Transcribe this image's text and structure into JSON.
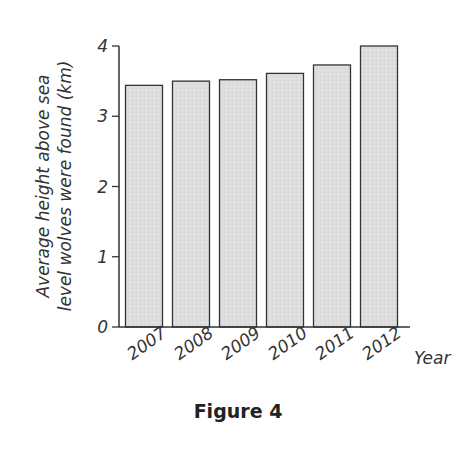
{
  "figure": {
    "caption": "Figure 4"
  },
  "chart_data": {
    "type": "bar",
    "title": "",
    "categories": [
      "2007",
      "2008",
      "2009",
      "2010",
      "2011",
      "2012"
    ],
    "values": [
      3.44,
      3.5,
      3.52,
      3.61,
      3.73,
      4.0
    ],
    "xlabel": "Year",
    "ylabel": "Average height above sea level wolves were found (km)",
    "ylabel_lines": [
      "Average height above sea",
      "level wolves were found (km)"
    ],
    "yticks": [
      0,
      1,
      2,
      3,
      4
    ],
    "ylim": [
      0,
      4
    ],
    "grid": false,
    "legend": null,
    "colors": {
      "bar_fill": "#dedede",
      "bar_stroke": "#333333",
      "axis": "#333333"
    }
  }
}
